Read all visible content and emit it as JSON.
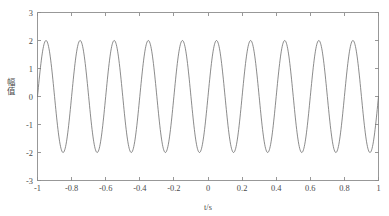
{
  "figure": {
    "background_color": "#ffffff",
    "axes_color": "#8d8d8d",
    "line_color": "#767676",
    "text_color": "#4a4a4a"
  },
  "axis": {
    "x_label": "t/s",
    "y_label": "幅值",
    "x_ticklabels": [
      "-1",
      "-0.8",
      "-0.6",
      "-0.4",
      "-0.2",
      "0",
      "0.2",
      "0.4",
      "0.6",
      "0.8",
      "1"
    ],
    "y_ticklabels": [
      "-3",
      "-2",
      "-1",
      "0",
      "1",
      "2",
      "3"
    ]
  },
  "chart_data": {
    "type": "line",
    "title": "",
    "xlabel": "t/s",
    "ylabel": "幅值",
    "xlim": [
      -1,
      1
    ],
    "ylim": [
      -3,
      3
    ],
    "xticks": [
      -1,
      -0.8,
      -0.6,
      -0.4,
      -0.2,
      0,
      0.2,
      0.4,
      0.6,
      0.8,
      1
    ],
    "yticks": [
      -3,
      -2,
      -1,
      0,
      1,
      2,
      3
    ],
    "grid": false,
    "legend": null,
    "series": [
      {
        "name": "signal",
        "color": "#767676",
        "equation": "y = 2*sin(2*pi*5*t)",
        "amplitude": 2,
        "frequency_hz": 5,
        "cycles_in_view": 10,
        "phase_rad": 0,
        "x_start": -1,
        "x_end": 1,
        "samples": 801,
        "peaks_y": 2,
        "troughs_y": -2,
        "peaks_x": [
          -0.95,
          -0.75,
          -0.55,
          -0.35,
          -0.15,
          0.05,
          0.25,
          0.45,
          0.65,
          0.85
        ],
        "troughs_x": [
          -0.9,
          -0.7,
          -0.5,
          -0.3,
          -0.1,
          0.1,
          0.3,
          0.5,
          0.7,
          0.9
        ]
      }
    ]
  }
}
